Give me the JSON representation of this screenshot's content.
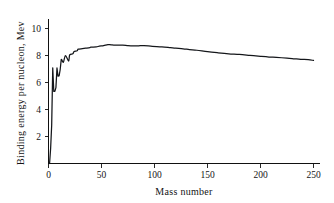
{
  "chart_data": {
    "type": "line",
    "title": "",
    "xlabel": "Mass number",
    "ylabel": "Binding energy per nucleon, Mev",
    "xlim": [
      0,
      260
    ],
    "ylim": [
      0,
      10.6
    ],
    "grid": false,
    "legend": false,
    "legend_position": "none",
    "xticks": [
      0,
      50,
      100,
      150,
      200,
      250
    ],
    "xticklabels": [
      "0",
      "50",
      "100",
      "150",
      "200",
      "250"
    ],
    "yticks": [
      2,
      4,
      6,
      8,
      10
    ],
    "yticklabels": [
      "2",
      "4",
      "6",
      "8",
      "10"
    ],
    "series": [
      {
        "name": "Binding energy per nucleon",
        "color": "#14161a",
        "x": [
          1,
          2,
          3,
          4,
          5,
          6,
          7,
          8,
          9,
          10,
          11,
          12,
          14,
          16,
          19,
          20,
          23,
          24,
          27,
          28,
          32,
          35,
          39,
          40,
          45,
          48,
          52,
          56,
          59,
          63,
          70,
          75,
          80,
          85,
          90,
          98,
          107,
          115,
          120,
          127,
          133,
          140,
          150,
          160,
          170,
          180,
          190,
          200,
          208,
          215,
          225,
          232,
          238,
          245,
          250
        ],
        "y": [
          0.0,
          1.11,
          2.83,
          7.07,
          5.33,
          5.33,
          5.61,
          7.06,
          6.46,
          6.48,
          6.93,
          7.68,
          7.48,
          7.98,
          7.57,
          8.03,
          8.11,
          8.26,
          8.33,
          8.45,
          8.49,
          8.52,
          8.56,
          8.6,
          8.62,
          8.67,
          8.71,
          8.79,
          8.77,
          8.75,
          8.75,
          8.71,
          8.69,
          8.7,
          8.71,
          8.66,
          8.62,
          8.56,
          8.52,
          8.48,
          8.42,
          8.37,
          8.26,
          8.18,
          8.11,
          8.06,
          7.99,
          7.92,
          7.87,
          7.84,
          7.79,
          7.74,
          7.7,
          7.67,
          7.62
        ]
      }
    ]
  },
  "axes": {
    "y_axis_label": "Binding energy per nucleon, Mev",
    "x_axis_label": "Mass number"
  }
}
